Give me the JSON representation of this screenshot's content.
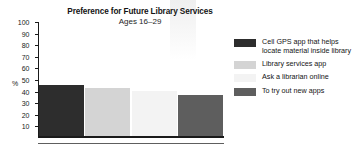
{
  "chart_data": {
    "type": "bar",
    "title": "Preference for Future Library Services",
    "subtitle": "Ages 16–29",
    "xlabel": "",
    "ylabel": "%",
    "ylim": [
      0,
      100
    ],
    "yticks": [
      10,
      20,
      30,
      40,
      50,
      60,
      70,
      80,
      90,
      100
    ],
    "grid": false,
    "legend_position": "right",
    "categories": [
      "Cell GPS app that helps locate material inside library",
      "Library services app",
      "Ask a librarian online",
      "To try out new apps"
    ],
    "values": [
      45,
      42,
      40,
      36
    ],
    "colors": [
      "#2d2d2d",
      "#d4d4d4",
      "#f3f3f3",
      "#5e5e5e"
    ]
  },
  "axis": {
    "unit_label": "%",
    "tick_labels": [
      "100",
      "90",
      "80",
      "70",
      "60",
      "50",
      "40",
      "30",
      "20",
      "10"
    ]
  },
  "legend": {
    "items": [
      {
        "label": "Cell GPS app that helps locate material inside library",
        "color": "#2d2d2d"
      },
      {
        "label": "Library services app",
        "color": "#d4d4d4"
      },
      {
        "label": "Ask a librarian online",
        "color": "#f3f3f3"
      },
      {
        "label": "To try out new apps",
        "color": "#5e5e5e"
      }
    ]
  }
}
